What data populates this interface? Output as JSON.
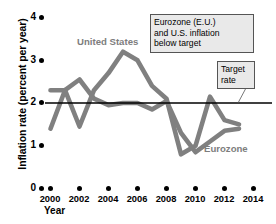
{
  "chart_data": {
    "type": "line",
    "title": "",
    "xlabel": "Year",
    "ylabel": "Inflation rate (percent per year)",
    "xlim": [
      1999,
      2014.5
    ],
    "ylim": [
      0,
      4
    ],
    "xticks": [
      "2000",
      "2002",
      "2004",
      "2006",
      "2008",
      "2010",
      "2012",
      "2014"
    ],
    "yticks": [
      "0",
      "1",
      "2",
      "3",
      "4"
    ],
    "grid": false,
    "legend_position": "inline-labels",
    "x": [
      2000,
      2001,
      2002,
      2003,
      2004,
      2005,
      2006,
      2007,
      2008,
      2009,
      2010,
      2011,
      2012,
      2013
    ],
    "series": [
      {
        "name": "United States",
        "values": [
          1.4,
          2.3,
          1.45,
          2.3,
          2.7,
          3.2,
          3.0,
          2.4,
          2.1,
          0.8,
          1.0,
          2.15,
          1.6,
          1.5
        ]
      },
      {
        "name": "Eurozone",
        "values": [
          2.3,
          2.3,
          2.55,
          2.1,
          1.95,
          2.0,
          2.0,
          1.85,
          2.05,
          1.3,
          0.85,
          1.1,
          1.35,
          1.4
        ]
      }
    ],
    "reference_line": {
      "name": "Target rate",
      "value": 2.0
    },
    "annotations": [
      {
        "name": "below-target-note",
        "text": "Eurozone (E.U.) and U.S. inflation below target"
      },
      {
        "name": "target-rate-note",
        "text": "Target rate"
      }
    ],
    "colors": {
      "series_line": "#808080",
      "reference_line": "#000000",
      "series_label": "#7d7d7d",
      "callout_background": "#e9e9e9",
      "callout_border": "#555555",
      "axis_text": "#000000"
    }
  },
  "annotations": {
    "note_line1": "Eurozone (E.U.)",
    "note_line2": "and U.S. inflation",
    "note_line3": "below target",
    "target_line1": "Target",
    "target_line2": "rate"
  }
}
